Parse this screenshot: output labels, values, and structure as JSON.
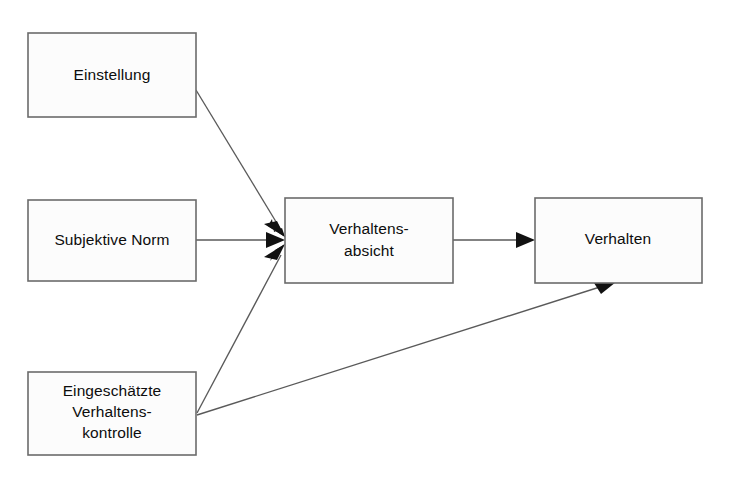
{
  "diagram": {
    "type": "flow-diagram",
    "canvas": {
      "width": 735,
      "height": 479
    },
    "style": {
      "background_color": "#ffffff",
      "box_fill_color": "#fcfcfc",
      "box_border_color": "#6b6b6b",
      "line_color": "#5a5a5a",
      "arrowhead_color": "#111111",
      "text_color": "#0d0d0d"
    },
    "nodes": [
      {
        "id": "einstellung",
        "label": "Einstellung",
        "lines": [
          "Einstellung"
        ],
        "x": 28,
        "y": 33,
        "width": 168,
        "height": 84
      },
      {
        "id": "subjektive-norm",
        "label": "Subjektive Norm",
        "lines": [
          "Subjektive Norm"
        ],
        "x": 28,
        "y": 200,
        "width": 168,
        "height": 81
      },
      {
        "id": "eingeschaetzte-verhaltenskontrolle",
        "label": "Eingeschätzte Verhaltens-kontrolle",
        "lines": [
          "Eingeschätzte",
          "Verhaltens-",
          "kontrolle"
        ],
        "x": 28,
        "y": 372,
        "width": 168,
        "height": 83
      },
      {
        "id": "verhaltensabsicht",
        "label": "Verhaltens-absicht",
        "lines": [
          "Verhaltens-",
          "absicht"
        ],
        "x": 285,
        "y": 198,
        "width": 168,
        "height": 85
      },
      {
        "id": "verhalten",
        "label": "Verhalten",
        "lines": [
          "Verhalten"
        ],
        "x": 535,
        "y": 198,
        "width": 167,
        "height": 85
      }
    ],
    "edges": [
      {
        "id": "einstellung-to-absicht",
        "from": "einstellung",
        "to": "verhaltensabsicht",
        "label": "",
        "x1": 196,
        "y1": 90,
        "x2": 284,
        "y2": 231
      },
      {
        "id": "norm-to-absicht",
        "from": "subjektive-norm",
        "to": "verhaltensabsicht",
        "label": "",
        "x1": 196,
        "y1": 240,
        "x2": 284,
        "y2": 240
      },
      {
        "id": "kontrolle-to-absicht",
        "from": "eingeschaetzte-verhaltenskontrolle",
        "to": "verhaltensabsicht",
        "label": "",
        "x1": 197,
        "y1": 413,
        "x2": 284,
        "y2": 250
      },
      {
        "id": "kontrolle-to-verhalten",
        "from": "eingeschaetzte-verhaltenskontrolle",
        "to": "verhalten",
        "label": "",
        "x1": 197,
        "y1": 415,
        "x2": 613,
        "y2": 283
      },
      {
        "id": "absicht-to-verhalten",
        "from": "verhaltensabsicht",
        "to": "verhalten",
        "label": "",
        "x1": 453,
        "y1": 240,
        "x2": 534,
        "y2": 240
      }
    ]
  }
}
